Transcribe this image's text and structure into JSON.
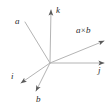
{
  "figure": {
    "name": "vector-cross-product-diagram",
    "background_color": "#ffffff",
    "line_color": "#b4b4b4",
    "label_color": "#2b2b2b",
    "origin": {
      "x": 50,
      "y": 63
    }
  },
  "labels": {
    "a": "a",
    "k": "k",
    "cross_a": "a",
    "cross_symbol": "×",
    "cross_b": "b",
    "j": "j",
    "i": "i",
    "b": "b"
  },
  "vectors": [
    {
      "id": "a",
      "label": "a",
      "from": {
        "x": 50,
        "y": 63
      },
      "to": {
        "x": 25,
        "y": 22
      },
      "arrowhead": false
    },
    {
      "id": "k",
      "label": "k",
      "from": {
        "x": 50,
        "y": 63
      },
      "to": {
        "x": 51,
        "y": 8
      },
      "arrowhead": true
    },
    {
      "id": "a-cross-b",
      "label": "a × b",
      "from": {
        "x": 50,
        "y": 63
      },
      "to": {
        "x": 106,
        "y": 40
      },
      "arrowhead": true
    },
    {
      "id": "j",
      "label": "j",
      "from": {
        "x": 50,
        "y": 63
      },
      "to": {
        "x": 106,
        "y": 63
      },
      "arrowhead": true
    },
    {
      "id": "i",
      "label": "i",
      "from": {
        "x": 50,
        "y": 63
      },
      "to": {
        "x": 19,
        "y": 84
      },
      "arrowhead": true
    },
    {
      "id": "b",
      "label": "b",
      "from": {
        "x": 50,
        "y": 63
      },
      "to": {
        "x": 35,
        "y": 93
      },
      "arrowhead": true
    }
  ]
}
